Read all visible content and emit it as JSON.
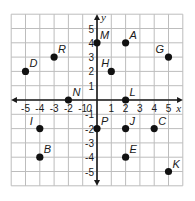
{
  "chart_data": {
    "type": "scatter",
    "title": "",
    "xlabel": "x",
    "ylabel": "y",
    "xlim": [
      -6,
      6
    ],
    "ylim": [
      -6,
      6
    ],
    "grid": true,
    "x_ticks": [
      "-5",
      "-4",
      "-3",
      "-2",
      "-1",
      "0",
      "1",
      "2",
      "3",
      "4",
      "5"
    ],
    "y_ticks": [
      "5",
      "4",
      "3",
      "2",
      "1",
      "-1",
      "-2",
      "-3",
      "-4",
      "-5"
    ],
    "points": [
      {
        "label": "M",
        "x": 0,
        "y": 4
      },
      {
        "label": "A",
        "x": 2,
        "y": 4
      },
      {
        "label": "G",
        "x": 5,
        "y": 3
      },
      {
        "label": "H",
        "x": 1,
        "y": 2
      },
      {
        "label": "R",
        "x": -3,
        "y": 3
      },
      {
        "label": "D",
        "x": -5,
        "y": 2
      },
      {
        "label": "N",
        "x": -2,
        "y": 0
      },
      {
        "label": "L",
        "x": 2,
        "y": 0
      },
      {
        "label": "I",
        "x": -4,
        "y": -2
      },
      {
        "label": "P",
        "x": 0,
        "y": -2
      },
      {
        "label": "J",
        "x": 2,
        "y": -2
      },
      {
        "label": "C",
        "x": 4,
        "y": -2
      },
      {
        "label": "B",
        "x": -4,
        "y": -4
      },
      {
        "label": "E",
        "x": 2,
        "y": -4
      },
      {
        "label": "K",
        "x": 5,
        "y": -5
      }
    ]
  },
  "colors": {
    "point": "#111111",
    "grid": "#bdbdbd",
    "axis": "#1a1a1a"
  }
}
